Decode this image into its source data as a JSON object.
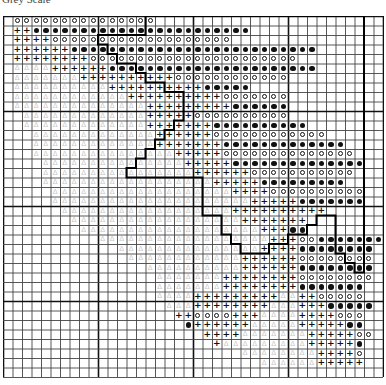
{
  "header": {
    "title": "Grey Scale"
  },
  "grid": {
    "cols": 40,
    "rows": 38,
    "cell_px": 9.5,
    "legend": {
      "o": "ring",
      "*": "dot",
      "+": "plus",
      "A": "triangle",
      ".": "empty"
    },
    "data": [
      ".ooooooooooooooo........................",
      ".++***********************..............",
      ".++++ooooooooooooooooooo................",
      ".++++++**************************.......",
      ".++++++++oooooooooooooooooooooo.........",
      ".AAAA++++++**********************.......",
      ".AAAAAAA++++++++++oooooooooooo..........",
      ".AAAAAAAAAA++++++++++*****..............",
      ".AAAAAAAAAAAA++++++++++ooooooo..........",
      ".AAAAAAAAAAAAAA+++++++++******..........",
      "..AAAAAAAAAAAAA+++++oooooooooo..........",
      "..AAAAAAAAAAAAA+++++++**********........",
      "...AAAAAAAAAAAAA++++++oooooooooooo......",
      "...AAAAAAAAAAAAA+++++++*************....",
      "...AAAAAAAAAAAAAAA+++++oooooooooooooo...",
      "....AAAAAAAAAAAAAAA+++++**************..",
      "....AAAAAAAAAAAAAAAA++++++ooooooooooo...",
      "....AAAAAAAAAAAAAAAAAA+++++*********....",
      ".....AAAAAAAAAAAAAAAAAAA++++oooooooooo..",
      ".....AAAAAAAAAAAAAAAAAAAAA+++++*******..",
      "......AAAAAAAAAAAAAAAAAA++++++++++......",
      ".......AAAAAAAAAAAAAAAAAA+++++++........",
      "........AAAAAAAAAAAAAAAAAAA+++**........",
      "..........AAAAAAAAAAAAAAAAAA+++oo*******",
      "............AAAAAAAAAAAAAAA++++********.",
      ".............AAAAAAAAAAAA++++++oooooooo.",
      "...............AAAAAAAAAA++++++********.",
      "................AAAAAAA++++++++oooooooo.",
      "................AAAAAAA++++++++*******..",
      "................AAAA+++++++++AA++ooooo..",
      ".................AAA++++++++AAA+++*****.",
      "..................++oooo+++AAAA++++ooo..",
      "...................*++++++AAAAA+++++**..",
      ".....................++++AAAAAAA+++++oo.",
      "......................+AAAAAAAAA+++++*..",
      ".........................AAAAAAAA++++o..",
      "...........................AAAAAA+++++..",
      "........................................"
    ],
    "outline_points": [
      [
        15,
        0
      ],
      [
        38,
        0
      ],
      [
        38,
        27
      ],
      [
        37,
        27
      ],
      [
        37,
        26
      ],
      [
        36,
        26
      ],
      [
        36,
        25
      ],
      [
        35,
        25
      ],
      [
        35,
        21
      ],
      [
        33,
        21
      ],
      [
        33,
        22
      ],
      [
        32,
        22
      ],
      [
        32,
        23
      ],
      [
        30,
        23
      ],
      [
        30,
        24
      ],
      [
        28,
        24
      ],
      [
        28,
        25
      ],
      [
        25,
        25
      ],
      [
        25,
        24
      ],
      [
        24,
        24
      ],
      [
        24,
        23
      ],
      [
        23,
        23
      ],
      [
        23,
        21
      ],
      [
        21,
        21
      ],
      [
        21,
        17
      ],
      [
        13,
        17
      ],
      [
        13,
        16
      ],
      [
        14,
        16
      ],
      [
        14,
        15
      ],
      [
        15,
        15
      ],
      [
        15,
        14
      ],
      [
        16,
        14
      ],
      [
        16,
        13
      ],
      [
        17,
        13
      ],
      [
        17,
        12
      ],
      [
        18,
        12
      ],
      [
        18,
        11
      ],
      [
        19,
        11
      ],
      [
        19,
        8
      ],
      [
        17,
        8
      ],
      [
        17,
        7
      ],
      [
        15,
        7
      ],
      [
        15,
        6
      ],
      [
        14,
        6
      ],
      [
        14,
        5
      ],
      [
        12,
        5
      ],
      [
        12,
        4
      ],
      [
        11,
        4
      ],
      [
        11,
        3
      ],
      [
        10,
        3
      ],
      [
        10,
        2
      ],
      [
        15,
        2
      ],
      [
        15,
        0
      ]
    ]
  },
  "colors": {
    "grid_line": "#444444",
    "major_line": "#111111",
    "symbol": "#111111",
    "triangle": "#c8c8c8",
    "outline": "#000000"
  }
}
